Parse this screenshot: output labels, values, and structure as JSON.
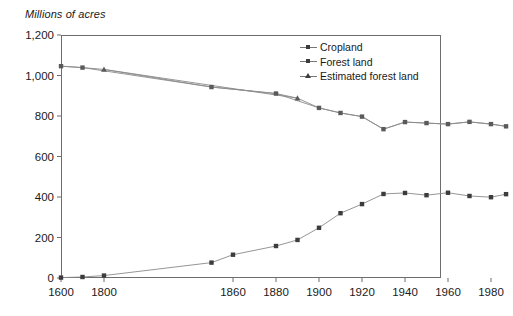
{
  "chart_data": {
    "type": "line",
    "title": "",
    "ylabel": "Millions of acres",
    "xlabel": "",
    "ylim": [
      0,
      1200
    ],
    "yticks": [
      0,
      200,
      400,
      600,
      800,
      1000,
      1200
    ],
    "ytick_labels": [
      "0",
      "200",
      "400",
      "600",
      "800",
      "1,000",
      "1,200"
    ],
    "xticks": [
      1600,
      1800,
      1860,
      1880,
      1900,
      1920,
      1940,
      1960,
      1980
    ],
    "xtick_labels": [
      "1600",
      "1800",
      "1860",
      "1880",
      "1900",
      "1920",
      "1940",
      "1960",
      "1980"
    ],
    "xlim": [
      1600,
      1990
    ],
    "grid": false,
    "legend_position": "upper-right",
    "series": [
      {
        "name": "Cropland",
        "marker": "square",
        "color": "#3c3c3c",
        "x": [
          1600,
          1700,
          1800,
          1850,
          1860,
          1880,
          1890,
          1900,
          1910,
          1920,
          1930,
          1940,
          1950,
          1960,
          1970,
          1980,
          1987
        ],
        "values": [
          2,
          5,
          12,
          76,
          115,
          158,
          188,
          248,
          320,
          365,
          415,
          420,
          409,
          421,
          405,
          399,
          414
        ]
      },
      {
        "name": "Forest land",
        "marker": "square",
        "color": "#5a5a5a",
        "x": [
          1600,
          1700,
          1850,
          1880,
          1900,
          1910,
          1920,
          1930,
          1940,
          1950,
          1960,
          1970,
          1980,
          1987
        ],
        "values": [
          1046,
          1039,
          943,
          911,
          840,
          815,
          797,
          735,
          770,
          765,
          760,
          771,
          760,
          749
        ]
      },
      {
        "name": "Estimated forest land",
        "marker": "triangle",
        "color": "#5a5a5a",
        "x": [
          1800,
          1890
        ],
        "values": [
          1030,
          888
        ]
      }
    ]
  },
  "legend": {
    "items": [
      {
        "label": "Cropland",
        "marker": "square"
      },
      {
        "label": "Forest land",
        "marker": "square"
      },
      {
        "label": "Estimated forest land",
        "marker": "triangle"
      }
    ]
  }
}
